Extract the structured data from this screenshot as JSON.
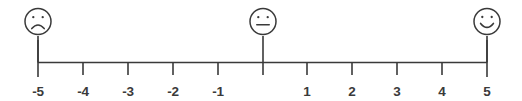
{
  "figure": {
    "stroke_color": "#3a3a3a",
    "background_color": "#ffffff"
  },
  "chart_data": {
    "type": "line",
    "title": "",
    "subtitle": "",
    "xlabel": "",
    "ylabel": "",
    "xlim": [
      -5,
      5
    ],
    "grid": false,
    "legend": false,
    "orientation": "horizontal",
    "categories": [
      "-5",
      "-4",
      "-3",
      "-2",
      "-1",
      "",
      "1",
      "2",
      "3",
      "4",
      "5"
    ],
    "values": [
      -5,
      -4,
      -3,
      -2,
      -1,
      0,
      1,
      2,
      3,
      4,
      5
    ],
    "tick_labels": [
      "-5",
      "-4",
      "-3",
      "-2",
      "-1",
      "",
      "1",
      "2",
      "3",
      "4",
      "5"
    ],
    "tick_values": [
      -5,
      -4,
      -3,
      -2,
      -1,
      0,
      1,
      2,
      3,
      4,
      5
    ],
    "zero_label_shown": false,
    "annotations": [
      {
        "value": -5,
        "icon": "sad-face-icon",
        "label": "sad face"
      },
      {
        "value": 0,
        "icon": "neutral-face-icon",
        "label": "neutral face"
      },
      {
        "value": 5,
        "icon": "happy-face-icon",
        "label": "happy face"
      }
    ]
  },
  "axis": {
    "ticks": [
      {
        "id": "tick-minus-5",
        "value": -5,
        "label": "-5",
        "x": 38,
        "endpoint": true
      },
      {
        "id": "tick-minus-4",
        "value": -4,
        "label": "-4",
        "x": 83,
        "endpoint": false
      },
      {
        "id": "tick-minus-3",
        "value": -3,
        "label": "-3",
        "x": 128,
        "endpoint": false
      },
      {
        "id": "tick-minus-2",
        "value": -2,
        "label": "-2",
        "x": 173,
        "endpoint": false
      },
      {
        "id": "tick-minus-1",
        "value": -1,
        "label": "-1",
        "x": 218,
        "endpoint": false
      },
      {
        "id": "tick-zero",
        "value": 0,
        "label": "",
        "x": 263,
        "endpoint": false
      },
      {
        "id": "tick-plus-1",
        "value": 1,
        "label": "1",
        "x": 307,
        "endpoint": false
      },
      {
        "id": "tick-plus-2",
        "value": 2,
        "label": "2",
        "x": 352,
        "endpoint": false
      },
      {
        "id": "tick-plus-3",
        "value": 3,
        "label": "3",
        "x": 397,
        "endpoint": false
      },
      {
        "id": "tick-plus-4",
        "value": 4,
        "label": "4",
        "x": 442,
        "endpoint": false
      },
      {
        "id": "tick-plus-5",
        "value": 5,
        "label": "5",
        "x": 487,
        "endpoint": true
      }
    ]
  },
  "faces": {
    "sad": {
      "name": "sad-face-icon",
      "value": -5,
      "x": 38,
      "mood": "sad"
    },
    "neutral": {
      "name": "neutral-face-icon",
      "value": 0,
      "x": 263,
      "mood": "neutral"
    },
    "happy": {
      "name": "happy-face-icon",
      "value": 5,
      "x": 487,
      "mood": "happy"
    }
  }
}
